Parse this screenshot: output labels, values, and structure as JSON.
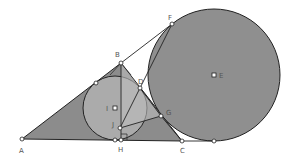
{
  "diagram": {
    "type": "geometry",
    "colors": {
      "background": "#ffffff",
      "triangle_fill": "#8c8c8c",
      "incircle_fill": "#ababab",
      "excircle_fill": "#8f8f8f",
      "inner_triangle_fill": "#bdbdbd",
      "stroke": "#222222",
      "point_fill": "#ffffff"
    },
    "points": {
      "A": {
        "label": "A",
        "x": 22,
        "y": 139
      },
      "B": {
        "label": "B",
        "x": 121,
        "y": 63
      },
      "C": {
        "label": "C",
        "x": 182,
        "y": 141
      },
      "D": {
        "label": "D",
        "x": 140,
        "y": 88
      },
      "E": {
        "label": "E",
        "x": 214,
        "y": 75
      },
      "F": {
        "label": "F",
        "x": 172,
        "y": 24
      },
      "G": {
        "label": "G",
        "x": 161,
        "y": 116
      },
      "H": {
        "label": "H",
        "x": 121,
        "y": 140
      },
      "I": {
        "label": "I",
        "x": 115,
        "y": 108
      },
      "J": {
        "label": "J",
        "x": 120,
        "y": 128
      }
    },
    "circles": {
      "incircle": {
        "center": "I",
        "r": 32
      },
      "excircle": {
        "center": "E",
        "r": 66
      }
    }
  }
}
